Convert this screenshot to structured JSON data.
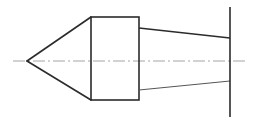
{
  "drawing": {
    "title": "Conical point tool profile - orthographic section",
    "canvas": {
      "width": 257,
      "height": 124,
      "background": "#ffffff"
    },
    "colors": {
      "outline": "#2b2b2b",
      "thin_outline": "#555555",
      "centerline": "#9a9a9a",
      "background": "#ffffff"
    },
    "stroke_widths": {
      "outline": 1.6,
      "thin": 1.0,
      "centerline": 0.9
    },
    "centerline": {
      "label": "axis-centerline",
      "x1": 13,
      "y1": 61,
      "x2": 246,
      "y2": 61,
      "dash_pattern": "12 3 2 3"
    },
    "cone": {
      "label": "conical-tip",
      "apex": {
        "x": 27,
        "y": 61
      },
      "upper_edge": {
        "x1": 27,
        "y1": 61,
        "x2": 91,
        "y2": 17
      },
      "lower_edge": {
        "x1": 27,
        "y1": 61,
        "x2": 91,
        "y2": 100
      }
    },
    "body_rectangle": {
      "label": "cylindrical-body",
      "x": 91,
      "y": 17,
      "width": 48,
      "height": 83
    },
    "taper": {
      "label": "tapered-shank",
      "upper_edge": {
        "x1": 139,
        "y1": 28,
        "x2": 230,
        "y2": 38
      },
      "lower_edge": {
        "x1": 139,
        "y1": 90,
        "x2": 230,
        "y2": 81
      }
    },
    "end_line": {
      "label": "right-end-face",
      "x1": 230,
      "y1": 7,
      "x2": 230,
      "y2": 117
    }
  }
}
